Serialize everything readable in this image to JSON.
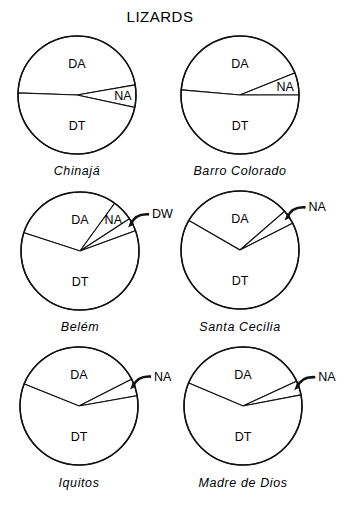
{
  "chart_data": {
    "type": "pie",
    "title": "Lizards",
    "units": "percent of species",
    "categories_legend": [
      "DA",
      "NA",
      "DW",
      "DT"
    ],
    "charts": [
      {
        "site": "Chinajá",
        "slices": [
          {
            "label": "DA",
            "value": 46.7
          },
          {
            "label": "NA",
            "value": 6.1
          },
          {
            "label": "DT",
            "value": 47.2
          }
        ]
      },
      {
        "site": "Barro Colorado",
        "slices": [
          {
            "label": "DA",
            "value": 42.5
          },
          {
            "label": "NA",
            "value": 6.1
          },
          {
            "label": "DT",
            "value": 51.4
          }
        ]
      },
      {
        "site": "Belém",
        "slices": [
          {
            "label": "DA",
            "value": 30.0
          },
          {
            "label": "NA",
            "value": 5.8
          },
          {
            "label": "DW",
            "value": 3.6
          },
          {
            "label": "DT",
            "value": 60.6
          }
        ]
      },
      {
        "site": "Santa Cecilia",
        "slices": [
          {
            "label": "DA",
            "value": 30.3
          },
          {
            "label": "NA",
            "value": 3.9
          },
          {
            "label": "DT",
            "value": 65.8
          }
        ]
      },
      {
        "site": "Iquitos",
        "slices": [
          {
            "label": "DA",
            "value": 36.4
          },
          {
            "label": "NA",
            "value": 4.7
          },
          {
            "label": "DT",
            "value": 58.9
          }
        ]
      },
      {
        "site": "Madre de Dios",
        "slices": [
          {
            "label": "DA",
            "value": 36.7
          },
          {
            "label": "NA",
            "value": 3.9
          },
          {
            "label": "DT",
            "value": 59.4
          }
        ]
      }
    ]
  },
  "display_title": "LIZARDS"
}
